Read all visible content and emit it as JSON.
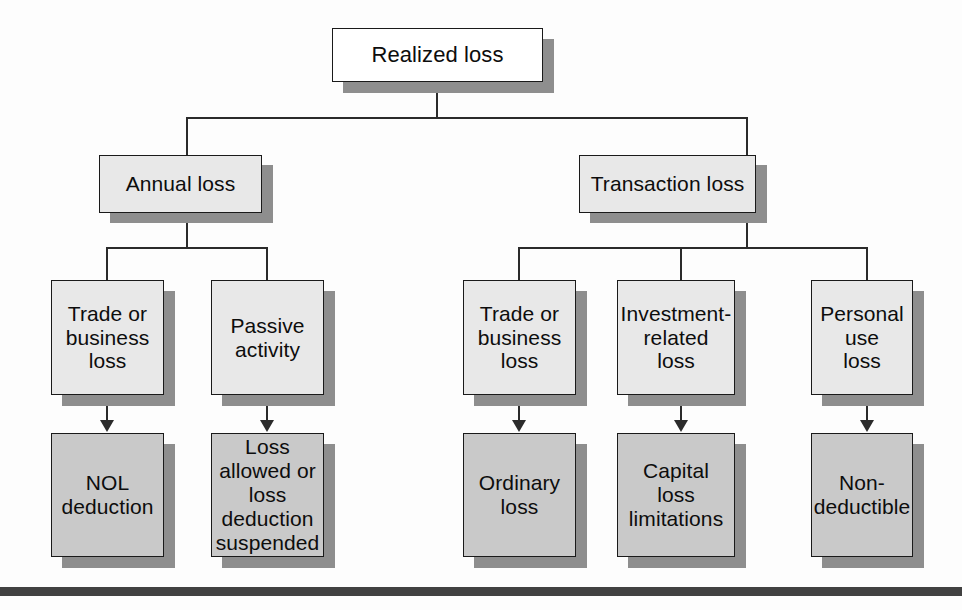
{
  "diagram": {
    "title_node": {
      "label": "Realized loss"
    },
    "level2": [
      {
        "label": "Annual loss"
      },
      {
        "label": "Transaction loss"
      }
    ],
    "level3": [
      {
        "label": "Trade or\nbusiness\nloss"
      },
      {
        "label": "Passive\nactivity"
      },
      {
        "label": "Trade or\nbusiness\nloss"
      },
      {
        "label": "Investment-\nrelated\nloss"
      },
      {
        "label": "Personal\nuse\nloss"
      }
    ],
    "level4": [
      {
        "label": "NOL\ndeduction"
      },
      {
        "label": "Loss\nallowed or\nloss\ndeduction\nsuspended"
      },
      {
        "label": "Ordinary\nloss"
      },
      {
        "label": "Capital\nloss\nlimitations"
      },
      {
        "label": "Non-\ndeductible"
      }
    ],
    "colors": {
      "root_fill": "#ffffff",
      "branch_fill": "#e8e8e8",
      "outcome_fill": "#c9c9c9",
      "stroke": "#1a1a1a",
      "shadow": "#8e8e8e",
      "rule": "#414141",
      "background": "#fdfdfd"
    }
  }
}
